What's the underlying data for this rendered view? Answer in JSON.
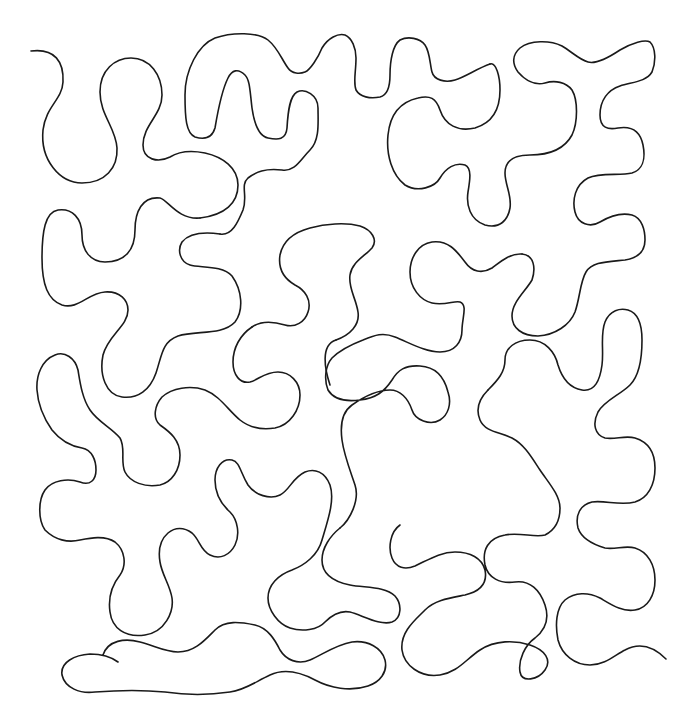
{
  "pattern": {
    "type": "continuous-line meander (stipple / puzzle quilting motif)",
    "background": "#ffffff",
    "stroke_color": "#1a1a1a",
    "stroke_width": 1.6,
    "start_point": [
      31,
      51
    ],
    "end_point": [
      666,
      659
    ]
  },
  "path_d": "M 31 51 C 55 48, 64 62, 63 82 C 62 100, 46 106, 43 130 C 40 160, 60 183, 82 183 C 105 183, 118 168, 117 148 C 116 128, 100 115, 100 92 C 100 70, 115 58, 131 58 C 150 58, 162 75, 162 95 C 162 115, 143 125, 143 145 C 143 160, 160 163, 172 157 C 180 152, 190 152, 205 154 C 222 157, 238 170, 238 185 C 238 205, 222 218, 200 218 C 180 218, 165 200, 155 198 C 140 197, 135 215, 135 235 C 135 255, 122 262, 105 262 C 90 262, 82 250, 82 235 C 82 218, 70 208, 58 210 C 45 213, 43 235, 43 260 C 43 285, 48 300, 60 305 C 75 310, 88 295, 100 292 C 115 289, 128 298, 128 310 C 128 325, 105 335, 102 355 C 100 375, 105 395, 120 397 C 138 399, 150 390, 155 375 C 160 360, 160 340, 175 335 C 195 330, 225 340, 240 320 C 248 305, 240 280, 225 268 C 210 260, 185 265, 180 255 C 175 240, 190 230, 210 232 C 222 233, 232 240, 238 250 M 31 51 Z",
  "path_segments": [
    "M 31 51 C 55 48, 64 62, 63 82 C 62 100, 46 106, 43 130 C 40 160, 60 183, 82 183 C 105 183, 118 168, 117 148 C 116 128, 100 115, 100 92 C 100 70, 115 58, 131 58 C 150 58, 162 75, 162 95 C 162 115, 143 125, 143 145 C 143 160, 158 163, 170 157 C 178 152, 190 150, 205 153 C 223 157, 238 168, 238 185 C 238 203, 225 215, 200 218",
    "M 200 218 C 178 220, 168 200, 160 198 C 142 196, 135 212, 135 230 C 135 250, 125 262, 105 262 C 90 262, 82 250, 82 235 C 82 218, 72 208, 58 210 C 45 212, 42 232, 42 258 C 42 285, 48 300, 62 305 C 78 310, 88 293, 105 292 C 120 291, 128 300, 128 310 C 128 326, 108 335, 103 355 C 99 375, 106 395, 122 397 C 138 399, 150 390, 156 373 C 162 355, 162 342, 178 336 C 196 330, 222 336, 235 322 C 244 310, 242 290, 232 276 C 222 265, 200 268, 190 265 C 180 262, 177 250, 182 242 C 190 232, 205 232, 220 234",
    "M 220 234 C 232 236, 238 222, 243 210 C 248 196, 240 185, 248 178 C 256 172, 265 168, 282 170 C 295 172, 300 160, 310 150 C 320 140, 318 122, 318 108 C 318 95, 305 88, 297 92 C 290 96, 288 110, 287 128 C 286 140, 278 140, 268 138 C 258 136, 254 122, 252 108 C 250 92, 250 80, 245 75 C 238 68, 232 70, 228 78 C 222 90, 218 110, 215 128 C 212 138, 205 140, 195 137 C 186 133, 185 118, 185 95 C 185 70, 198 45, 215 38 C 232 32, 258 32, 268 40 C 278 48, 282 60, 288 68 C 292 74, 300 74, 305 72 C 310 70, 318 58, 322 48 C 328 38, 338 33, 345 35 C 352 38, 356 48, 356 58 C 356 72, 353 82, 356 90 C 360 97, 370 99, 380 97 C 388 95, 390 85, 390 75 C 390 60, 393 45, 400 40 C 408 36, 420 38, 425 45 C 430 52, 430 65, 432 72 C 434 80, 445 83, 455 80 C 465 77, 478 68, 490 64",
    "M 490 64 C 496 62, 500 76, 500 90 C 500 105, 495 122, 475 128 C 458 132, 445 125, 440 110 C 436 98, 430 95, 418 98 C 400 102, 390 115, 388 135 C 386 155, 392 175, 405 185 C 418 193, 435 187, 440 178 C 446 168, 455 162, 465 165 C 472 168, 470 180, 468 192 C 466 205, 470 220, 485 225 C 500 229, 508 220, 510 208 C 512 195, 505 185, 505 173 C 505 160, 515 155, 530 155 C 550 155, 565 148, 572 135 C 578 122, 578 100, 572 90 C 566 82, 555 80, 545 83 C 535 86, 525 80, 518 72 C 512 64, 512 55, 520 48 C 530 40, 550 40, 562 46 C 572 52, 580 60, 588 62 C 595 64, 608 58, 620 50 C 632 43, 645 39, 650 42 C 656 48, 656 62, 652 72 C 646 82, 632 82, 620 86 C 608 90, 600 100, 600 115 C 600 128, 608 130, 618 128 C 630 126, 640 130, 643 145 C 646 160, 642 170, 632 173 C 620 176, 600 172, 588 178 C 575 185, 572 200, 575 212 C 578 224, 590 228, 600 222 C 610 216, 620 212, 632 215 C 642 218, 645 230, 645 240 C 645 252, 638 258, 625 260 C 605 262, 592 262, 586 272 C 580 282, 580 298, 575 312 C 570 325, 555 335, 538 336 C 522 336, 512 328, 512 316 C 512 302, 525 292, 532 280 C 536 268, 534 255, 522 254",
    "M 522 254 C 510 253, 500 262, 492 268 C 482 274, 472 272, 465 262 C 456 250, 448 240, 432 242 C 418 244, 410 258, 410 272 C 410 288, 420 300, 432 303 C 445 306, 455 300, 460 302 C 468 305, 462 318, 462 330 C 462 342, 455 352, 440 352 C 425 352, 410 343, 395 337 C 383 332, 375 335, 363 340 C 350 345, 340 350, 332 358 C 325 366, 324 380, 328 390 C 334 400, 345 402, 360 400 C 376 398, 384 392, 392 380 C 398 370, 405 365, 420 366 C 438 367, 445 380, 448 392 C 452 404, 448 415, 440 420 C 430 426, 415 420, 412 410 C 408 398, 400 390, 390 390 C 376 390, 362 398, 352 405 C 342 412, 340 425, 342 440 C 344 455, 350 470, 355 485 C 360 500, 350 520, 340 528",
    "M 340 528 C 330 536, 322 548, 322 560 C 322 575, 335 582, 350 585 C 365 588, 385 586, 395 596 C 402 604, 402 618, 392 622 C 380 626, 362 615, 350 612 C 340 610, 332 615, 325 622 C 318 630, 302 632, 290 628 C 278 624, 268 610, 268 598 C 268 585, 278 575, 292 570 C 305 565, 318 555, 322 540 C 328 520, 335 500, 330 485 C 325 472, 315 468, 305 472 C 292 478, 290 490, 280 495 C 270 500, 255 495, 248 485 C 240 472, 240 462, 232 460 C 222 458, 215 468, 215 480 C 215 494, 222 505, 230 512 C 238 520, 240 535, 235 545 C 230 555, 220 560, 210 555 C 200 550, 200 540, 192 533 C 184 527, 175 527, 168 533 C 160 540, 158 550, 160 562 C 162 575, 170 585, 172 598 C 174 612, 165 632, 145 635 C 125 638, 112 628, 110 612 C 108 598, 112 585, 120 575 C 127 565, 125 550, 115 542 C 105 535, 90 538, 80 540 C 68 543, 55 540, 45 530 C 38 520, 38 500, 45 490 C 52 480, 68 478, 80 482 C 90 486, 96 480, 96 470 C 96 460, 92 450, 82 448 C 70 446, 60 440, 52 430 C 45 420, 38 405, 37 390 C 36 375, 42 360, 55 355 C 65 351, 75 358, 78 370 C 80 382, 82 398, 90 410 C 98 422, 112 428, 120 438 C 126 448, 120 462, 125 472 C 130 482, 145 488, 160 485 C 172 482, 180 470, 180 455 C 180 440, 170 432, 160 425 C 152 418, 155 405, 162 397 C 172 388, 190 385, 205 390 C 220 396, 228 410, 240 420 C 250 428, 262 430, 275 428 C 290 425, 300 410, 300 395 C 300 382, 290 372, 278 372 C 265 372, 258 380, 250 382 C 240 384, 233 375, 233 362 C 233 348, 240 335, 252 327",
    "M 252 327 C 262 320, 275 322, 285 325 C 295 328, 305 322, 308 312 C 312 300, 305 290, 295 285 C 283 278, 278 268, 280 255 C 283 240, 295 232, 310 228 C 325 224, 345 222, 360 226 C 372 230, 378 240, 372 248 C 365 256, 352 262, 350 275 C 348 288, 356 298, 358 312 C 360 325, 350 335, 336 340",
    "M 252 327 M 400 525 C 390 532, 388 548, 392 558 C 396 568, 405 570, 415 566 C 428 560, 440 552, 455 552 C 470 552, 482 558, 485 570 C 488 585, 478 592, 465 595 C 450 598, 435 600, 425 610 C 415 620, 400 632, 402 650 C 404 665, 420 678, 440 675 C 458 672, 465 660, 480 650 C 495 640, 515 640, 530 645 C 545 650, 552 660, 545 670 C 538 680, 522 683, 520 672 C 518 660, 525 645, 535 638 C 545 630, 550 620, 545 605 C 540 590, 530 580, 515 582 C 500 584, 488 578, 485 565 C 482 550, 488 538, 505 535 C 520 532, 535 538, 545 535 C 555 530, 560 520, 560 508 C 560 495, 548 482, 540 470 C 532 458, 525 445, 512 438 C 500 432, 485 432, 480 420 C 475 408, 480 398, 488 390",
    "M 488 390 C 498 380, 505 372, 505 360 C 505 348, 515 340, 530 340 C 545 340, 555 352, 558 365 C 562 378, 570 388, 582 390 C 595 392, 600 380, 602 365 C 604 350, 600 335, 605 322 C 610 310, 620 308, 628 310 C 638 313, 642 325, 642 340 C 642 358, 640 375, 630 385 C 620 395, 605 400, 598 412 C 592 424, 595 435, 605 438 C 615 440, 625 435, 635 438 C 648 442, 655 452, 655 468 C 655 485, 648 498, 635 502 C 620 506, 605 500, 592 502 C 580 505, 575 515, 578 528 C 582 540, 595 545, 605 548 C 615 550, 625 545, 635 548 C 648 552, 655 565, 655 580 C 655 595, 648 608, 635 610 C 622 612, 612 605, 600 598 C 588 592, 575 592, 565 600 C 556 608, 555 625, 558 640 C 562 655, 575 665, 590 665 C 605 665, 615 655, 625 650 C 638 643, 652 645, 666 659",
    "M 336 340 C 320 345, 325 370, 330 385",
    "M 103 655 C 108 640, 125 638, 140 642 C 155 646, 165 652, 178 652 C 195 652, 205 640, 215 630 C 225 620, 240 622, 255 625 C 268 628, 275 640, 280 650 C 286 660, 298 665, 310 660 C 322 655, 335 645, 352 642 C 368 640, 382 648, 385 660 C 388 672, 380 682, 368 686 C 350 692, 330 688, 315 680 C 300 672, 285 668, 270 675 C 255 682, 245 690, 230 692 C 210 695, 185 695, 165 692 C 145 690, 120 690, 95 692 C 80 694, 65 688, 62 675 C 60 662, 75 655, 90 654 C 100 654, 110 656, 118 662"
  ]
}
